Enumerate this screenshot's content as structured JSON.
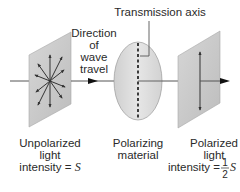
{
  "diagram": {
    "type": "polarization-schematic",
    "labels": {
      "transmission_axis": "Transmission axis",
      "direction": [
        "Direction",
        "of",
        "wave",
        "travel"
      ],
      "unpolarized": {
        "lines": [
          "Unpolarized",
          "light"
        ],
        "intensity_prefix": "intensity = ",
        "intensity_symbol": "S"
      },
      "polarizer": {
        "lines": [
          "Polarizing",
          "material"
        ]
      },
      "polarized": {
        "lines": [
          "Polarized",
          "light"
        ],
        "intensity_prefix": "intensity = ",
        "fraction_numerator": "1",
        "fraction_denominator": "2",
        "intensity_symbol": "S"
      }
    },
    "colors": {
      "panel_fill": "#c9c9c9",
      "panel_edge": "#a8a8a8",
      "ellipse_fill": "#dcdcdc",
      "ellipse_edge": "#9a9a9a",
      "line": "#444444",
      "arrow": "#111111",
      "text": "#2a2a2a"
    }
  }
}
